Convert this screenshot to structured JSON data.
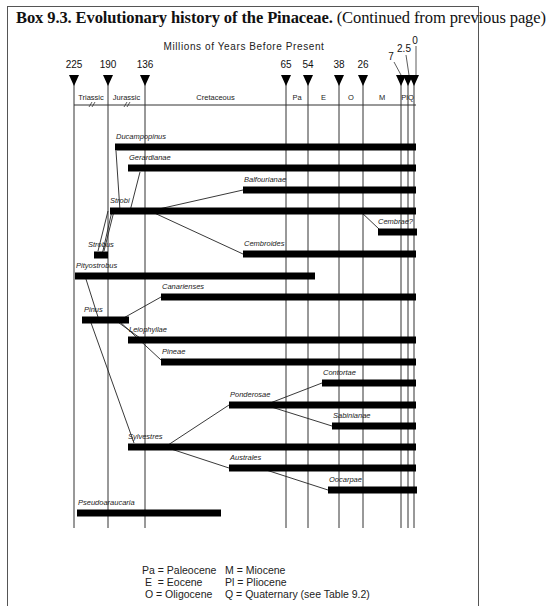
{
  "title": {
    "bold": "Box 9.3. Evolutionary history of the Pinaceae.",
    "normal": " (Continued from previous page)"
  },
  "chart_data": {
    "type": "timeline",
    "title": "Evolutionary history of the Pinaceae",
    "xlabel": "Millions of Years Before Present",
    "ticks": [
      {
        "label": "225",
        "value": 225
      },
      {
        "label": "190",
        "value": 190
      },
      {
        "label": "136",
        "value": 136
      },
      {
        "label": "65",
        "value": 65
      },
      {
        "label": "54",
        "value": 54
      },
      {
        "label": "38",
        "value": 38
      },
      {
        "label": "26",
        "value": 26
      },
      {
        "label": "7",
        "value": 7
      },
      {
        "label": "2.5",
        "value": 2.5
      },
      {
        "label": "0",
        "value": 0
      }
    ],
    "periods": [
      {
        "label": "Triassic",
        "from": 225,
        "to": 190
      },
      {
        "label": "Jurassic",
        "from": 190,
        "to": 136
      },
      {
        "label": "Cretaceous",
        "from": 136,
        "to": 65
      },
      {
        "label": "Pa",
        "from": 65,
        "to": 54
      },
      {
        "label": "E",
        "from": 54,
        "to": 38
      },
      {
        "label": "O",
        "from": 38,
        "to": 26
      },
      {
        "label": "M",
        "from": 26,
        "to": 7
      },
      {
        "label": "Pl",
        "from": 7,
        "to": 2.5
      },
      {
        "label": "Q",
        "from": 2.5,
        "to": 0
      }
    ],
    "taxa": [
      {
        "name": "Ducampopinus",
        "start": 185,
        "end": 0
      },
      {
        "name": "Gerardianae",
        "start": 165,
        "end": 0
      },
      {
        "name": "Balfourianae",
        "start": 90,
        "end": 0
      },
      {
        "name": "Strobi",
        "start": 195,
        "end": 0
      },
      {
        "name": "Cembrae?",
        "start": 22,
        "end": 0
      },
      {
        "name": "Strobus",
        "start": 212,
        "end": 205
      },
      {
        "name": "Cembroides",
        "start": 90,
        "end": 0
      },
      {
        "name": "Pityostrobus",
        "start": 225,
        "end": 64
      },
      {
        "name": "Canarienses",
        "start": 145,
        "end": 0
      },
      {
        "name": "Pinus",
        "start": 218,
        "end": 175
      },
      {
        "name": "Leiophyllae",
        "start": 165,
        "end": 0
      },
      {
        "name": "Pineae",
        "start": 145,
        "end": 0
      },
      {
        "name": "Contortae",
        "start": 55,
        "end": 0
      },
      {
        "name": "Ponderosae",
        "start": 115,
        "end": 0
      },
      {
        "name": "Sabinianae",
        "start": 50,
        "end": 0
      },
      {
        "name": "Sylvestres",
        "start": 165,
        "end": 0
      },
      {
        "name": "Australes",
        "start": 115,
        "end": 0
      },
      {
        "name": "Oocarpae",
        "start": 52,
        "end": 0
      },
      {
        "name": "Pseudoaraucaria",
        "start": 223,
        "end": 95
      }
    ],
    "links": [
      [
        "Strobi",
        "Ducampopinus"
      ],
      [
        "Strobi",
        "Gerardianae"
      ],
      [
        "Strobi",
        "Balfourianae"
      ],
      [
        "Strobi",
        "Cembroides"
      ],
      [
        "Strobi",
        "Cembrae?"
      ],
      [
        "Strobus",
        "Strobi"
      ],
      [
        "Pinus",
        "Canarienses"
      ],
      [
        "Pinus",
        "Leiophyllae"
      ],
      [
        "Pinus",
        "Pineae"
      ],
      [
        "Pinus",
        "Sylvestres"
      ],
      [
        "Pityostrobus",
        "Pinus"
      ],
      [
        "Sylvestres",
        "Ponderosae"
      ],
      [
        "Sylvestres",
        "Australes"
      ],
      [
        "Ponderosae",
        "Contortae"
      ],
      [
        "Ponderosae",
        "Sabinianae"
      ],
      [
        "Australes",
        "Oocarpae"
      ]
    ]
  },
  "legend": {
    "left": [
      "Pa = Paleocene",
      " E  = Eocene",
      " O = Oligocene"
    ],
    "right": [
      "M = Miocene",
      "Pl = Pliocene",
      "Q = Quaternary (see Table 9.2)"
    ]
  }
}
